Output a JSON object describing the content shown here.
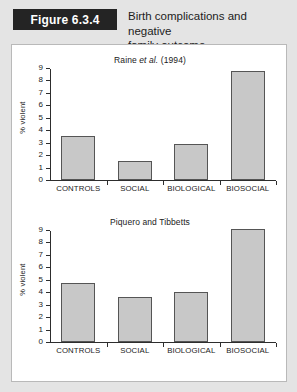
{
  "header": {
    "figure_tag": "Figure 6.3.4",
    "title_line1": "Birth complications and negative",
    "title_line2": "family outcome",
    "tag_bg": "#242424",
    "tag_fg": "#ffffff",
    "page_bg": "#e4e4e4"
  },
  "chart_data": [
    {
      "type": "bar",
      "title_prefix": "Raine ",
      "title_italic": "et al.",
      "title_suffix": " (1994)",
      "title": "Raine et al. (1994)",
      "categories": [
        "CONTROLS",
        "SOCIAL",
        "BIOLOGICAL",
        "BIOSOCIAL"
      ],
      "values": [
        3.5,
        1.5,
        2.9,
        8.8
      ],
      "xlabel": "",
      "ylabel": "% violent",
      "ylim": [
        0,
        9
      ],
      "yticks": [
        0,
        1,
        2,
        3,
        4,
        5,
        6,
        7,
        8,
        9
      ],
      "ytick_labels": [
        "0",
        "1",
        "2",
        "3",
        "4",
        "5",
        "6",
        "7",
        "8",
        "9"
      ],
      "grid": false,
      "legend": false,
      "bar_fill": "#c8c8c8",
      "bar_edge": "#555555"
    },
    {
      "type": "bar",
      "title_prefix": "Piquero and Tibbetts",
      "title_italic": "",
      "title_suffix": "",
      "title": "Piquero and Tibbetts",
      "categories": [
        "CONTROLS",
        "SOCIAL",
        "BIOLOGICAL",
        "BIOSOCIAL"
      ],
      "values": [
        4.75,
        3.65,
        4.0,
        9.1
      ],
      "xlabel": "",
      "ylabel": "% violent",
      "ylim": [
        0,
        9
      ],
      "yticks": [
        0,
        1,
        2,
        3,
        4,
        5,
        6,
        7,
        8,
        9
      ],
      "ytick_labels": [
        "0",
        "1",
        "2",
        "3",
        "4",
        "5",
        "6",
        "7",
        "8",
        "9"
      ],
      "grid": false,
      "legend": false,
      "bar_fill": "#c8c8c8",
      "bar_edge": "#555555"
    }
  ]
}
